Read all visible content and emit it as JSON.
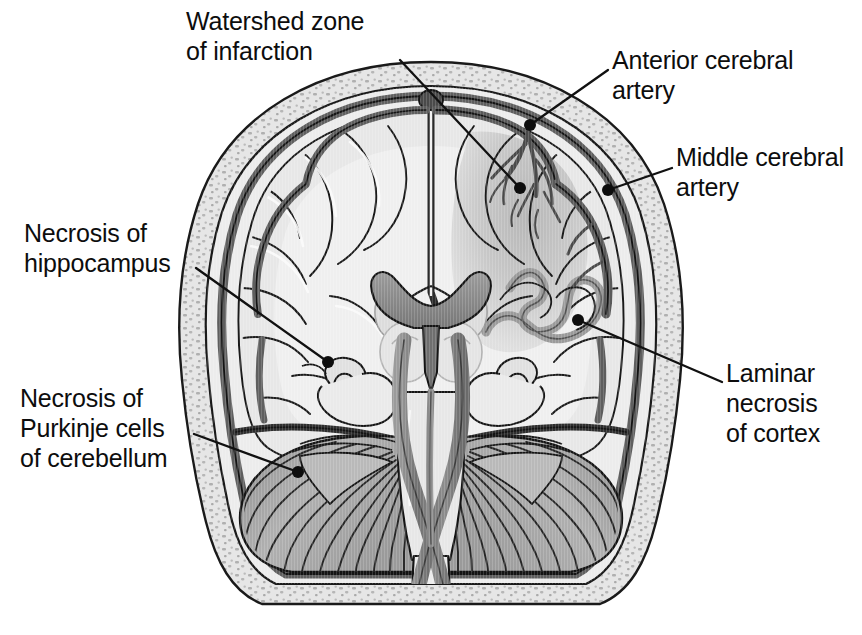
{
  "figure": {
    "view": "coronal-section",
    "background_color": "#ffffff",
    "line_color": "#1a1a1a",
    "palette": {
      "paper": "#ffffff",
      "outer_skull_table": "#e3e3e3",
      "diploe_stipple": "#b8b8b8",
      "dura": "#6e6e6e",
      "subarachnoid": "#d4d4d4",
      "cortex_gray": "#dcdcdc",
      "white_matter": "#e9e9e9",
      "deep_nuclei": "#d0d0d0",
      "ventricle": "#8c8c8c",
      "infarct_zone": "#bdbdbd",
      "laminar_ribbon": "#9a9a9a",
      "cerebellum": "#a9a9a9",
      "cerebellum_folia": "#2b2b2b",
      "brainstem": "#e0e0e0",
      "vessel": "#7a7a7a",
      "artery_dark": "#4a4a4a",
      "leader_line": "#111111",
      "label_text": "#0d0d0d"
    }
  },
  "labels": [
    {
      "id": "watershed",
      "text": "Watershed zone\nof infarction",
      "lines": [
        "Watershed zone",
        "of infarction"
      ],
      "side": "top",
      "leader_from": [
        400,
        60
      ],
      "leader_to": [
        520,
        188
      ],
      "dot": [
        520,
        188
      ]
    },
    {
      "id": "anterior-cerebral-artery",
      "text": "Anterior cerebral\nartery",
      "lines": [
        "Anterior cerebral",
        "artery"
      ],
      "side": "right",
      "leader_from": [
        608,
        70
      ],
      "leader_to": [
        530,
        125
      ],
      "dot": [
        530,
        125
      ]
    },
    {
      "id": "middle-cerebral-artery",
      "text": "Middle cerebral\nartery",
      "lines": [
        "Middle cerebral",
        "artery"
      ],
      "side": "right",
      "leader_from": [
        672,
        168
      ],
      "leader_to": [
        608,
        190
      ],
      "dot": [
        608,
        190
      ]
    },
    {
      "id": "necrosis-of-hippocampus",
      "text": "Necrosis of\nhippocampus",
      "lines": [
        "Necrosis of",
        "hippocampus"
      ],
      "side": "left",
      "leader_from": [
        196,
        268
      ],
      "leader_to": [
        328,
        362
      ],
      "dot": [
        328,
        362
      ]
    },
    {
      "id": "necrosis-of-purkinje-cells",
      "text": "Necrosis of\nPurkinje cells\nof cerebellum",
      "lines": [
        "Necrosis of",
        "Purkinje cells",
        "of cerebellum"
      ],
      "side": "left",
      "leader_from": [
        194,
        434
      ],
      "leader_to": [
        298,
        472
      ],
      "dot": [
        298,
        472
      ]
    },
    {
      "id": "laminar-necrosis-of-cortex",
      "text": "Laminar\nnecrosis\nof cortex",
      "lines": [
        "Laminar",
        "necrosis",
        "of cortex"
      ],
      "side": "right",
      "leader_from": [
        722,
        382
      ],
      "leader_to": [
        578,
        320
      ],
      "dot": [
        578,
        320
      ]
    }
  ],
  "structures": [
    {
      "name": "skull-outer-table",
      "description": "outer cortical bone of calvarium"
    },
    {
      "name": "skull-diploe",
      "description": "stippled cancellous bone between tables"
    },
    {
      "name": "dura-mater",
      "description": "dark band beneath inner table"
    },
    {
      "name": "superior-sagittal-sinus",
      "description": "midline dural venous sinus at vertex"
    },
    {
      "name": "falx-cerebri",
      "description": "midline dural septum between hemispheres"
    },
    {
      "name": "cerebral-cortex",
      "description": "gyri and sulci of both hemispheres"
    },
    {
      "name": "white-matter",
      "description": "centrum semiovale"
    },
    {
      "name": "lateral-ventricles",
      "description": "dark crescent-shaped ventricular cavity"
    },
    {
      "name": "third-ventricle",
      "description": "midline vertical slit below lateral ventricles"
    },
    {
      "name": "basal-ganglia",
      "description": "deep gray nuclei lateral to ventricles"
    },
    {
      "name": "thalamus",
      "description": "paired ovoid nuclei flanking third ventricle"
    },
    {
      "name": "hippocampus",
      "description": "scroll-shaped medial temporal structure, both sides"
    },
    {
      "name": "temporal-lobe",
      "description": "inferolateral cortex on both sides"
    },
    {
      "name": "tentorium-cerebelli",
      "description": "dural shelf above cerebellum"
    },
    {
      "name": "cerebellar-hemispheres",
      "description": "foliated cerebellum with radiating folia"
    },
    {
      "name": "brainstem",
      "description": "pons and medulla in midline"
    },
    {
      "name": "vertebral-arteries",
      "description": "paired vessels crossing in X over brainstem"
    },
    {
      "name": "basilar-artery",
      "description": "midline vessel on ventral brainstem"
    },
    {
      "name": "spinal-cord",
      "description": "continuation below foramen magnum"
    },
    {
      "name": "watershed-infarct",
      "description": "wedge of darker shading in border-zone territory"
    },
    {
      "name": "laminar-necrosis-ribbon",
      "description": "gray ribbon tracking cortical ribbon of right hemisphere"
    }
  ]
}
